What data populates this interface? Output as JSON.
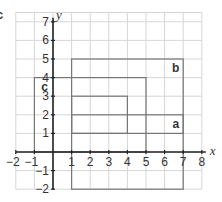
{
  "corner_label": "c",
  "axes": {
    "x_label": "x",
    "y_label": "y",
    "x_ticks": [
      -2,
      -1,
      1,
      2,
      3,
      4,
      5,
      6,
      7,
      8
    ],
    "y_ticks": [
      -2,
      -1,
      1,
      2,
      3,
      4,
      5,
      6,
      7
    ],
    "x_range": [
      -2,
      8
    ],
    "y_range": [
      -2,
      7.5
    ]
  },
  "shapes": [
    {
      "name": "b",
      "x1": 1,
      "y1": -2,
      "x2": 7,
      "y2": 5,
      "label_at": [
        6.6,
        4.5
      ]
    },
    {
      "name": "c",
      "x1": -1,
      "y1": 0,
      "x2": 5,
      "y2": 4,
      "label_at": [
        -0.45,
        3.5
      ]
    },
    {
      "name": "inner",
      "x1": 1,
      "y1": 1,
      "x2": 4,
      "y2": 3,
      "label_at": null
    },
    {
      "name": "a",
      "x1": 1,
      "y1": 1,
      "x2": 7,
      "y2": 2,
      "label_at": [
        6.6,
        1.5
      ]
    }
  ],
  "colors": {
    "grid": "#d6d6d6",
    "axis": "#222222",
    "shape": "#777777",
    "text": "#333333"
  }
}
